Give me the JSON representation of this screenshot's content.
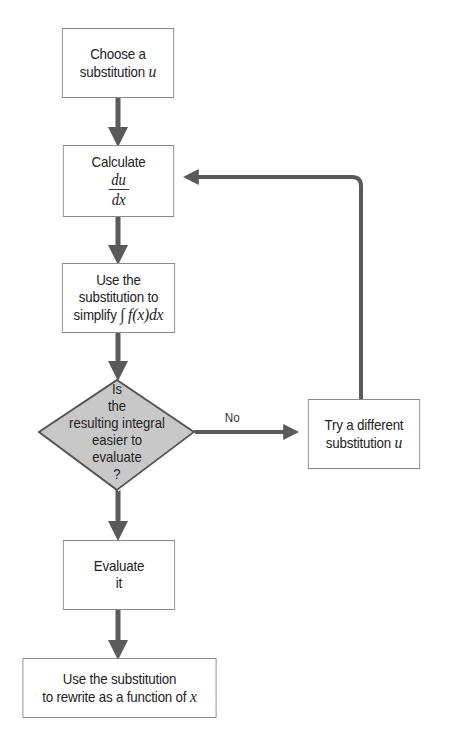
{
  "diagram": {
    "type": "flowchart",
    "nodes": [
      {
        "id": "choose",
        "shape": "rect",
        "line1": "Choose a",
        "line2": "substitution",
        "var": "u"
      },
      {
        "id": "calculate",
        "shape": "rect",
        "line1": "Calculate",
        "num": "du",
        "den": "dx"
      },
      {
        "id": "simplify",
        "shape": "rect",
        "line1": "Use the",
        "line2": "substitution to",
        "line3": "simplify",
        "math": "∫ f(x)dx"
      },
      {
        "id": "decision",
        "shape": "diamond",
        "lines": [
          "Is",
          "the",
          "resulting integral",
          "easier to",
          "evaluate",
          "?"
        ]
      },
      {
        "id": "retry",
        "shape": "rect",
        "line1": "Try a different",
        "line2": "substitution",
        "var": "u"
      },
      {
        "id": "evaluate",
        "shape": "rect",
        "line1": "Evaluate",
        "line2": "it"
      },
      {
        "id": "rewrite",
        "shape": "rect",
        "line1": "Use the substitution",
        "line2": "to rewrite as a function of",
        "var": "x"
      }
    ],
    "edges": [
      {
        "from": "choose",
        "to": "calculate",
        "label": ""
      },
      {
        "from": "calculate",
        "to": "simplify",
        "label": ""
      },
      {
        "from": "simplify",
        "to": "decision",
        "label": ""
      },
      {
        "from": "decision",
        "to": "retry",
        "label": "No"
      },
      {
        "from": "retry",
        "to": "calculate",
        "label": ""
      },
      {
        "from": "decision",
        "to": "evaluate",
        "label": ""
      },
      {
        "from": "evaluate",
        "to": "rewrite",
        "label": ""
      }
    ],
    "colors": {
      "arrow": "#5a5a5a",
      "box_border": "#8a8a8a",
      "diamond_fill": "#c8c8c8",
      "diamond_border": "#555555"
    }
  }
}
